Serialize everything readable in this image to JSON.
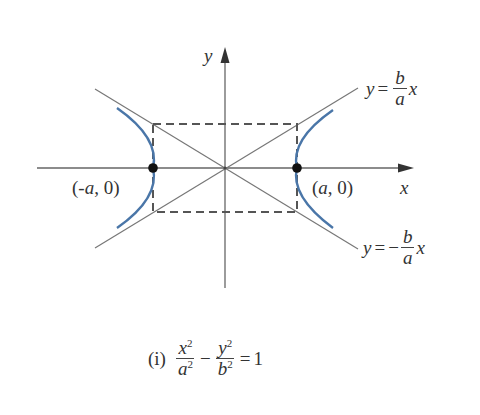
{
  "diagram": {
    "axes": {
      "x_label": "x",
      "y_label": "y"
    },
    "vertices": [
      {
        "label_pre": "(",
        "label_var": "-a",
        "label_post": ", 0)"
      },
      {
        "label_pre": "(",
        "label_var": "a",
        "label_post": ", 0)"
      }
    ],
    "asymptotes": [
      {
        "lhs": "y",
        "eq": "=",
        "sign": "",
        "num": "b",
        "den": "a",
        "var": "x"
      },
      {
        "lhs": "y",
        "eq": "=",
        "sign": "−",
        "num": "b",
        "den": "a",
        "var": "x"
      }
    ],
    "equation": {
      "label": "(i)",
      "term1_num": "x",
      "term1_num_exp": "2",
      "term1_den": "a",
      "term1_den_exp": "2",
      "minus": "−",
      "term2_num": "y",
      "term2_num_exp": "2",
      "term2_den": "b",
      "term2_den_exp": "2",
      "equals": "=",
      "rhs": "1"
    },
    "colors": {
      "curve": "#4a76a8",
      "lines": "#666666",
      "dashed": "#555555",
      "points": "#111111"
    }
  }
}
